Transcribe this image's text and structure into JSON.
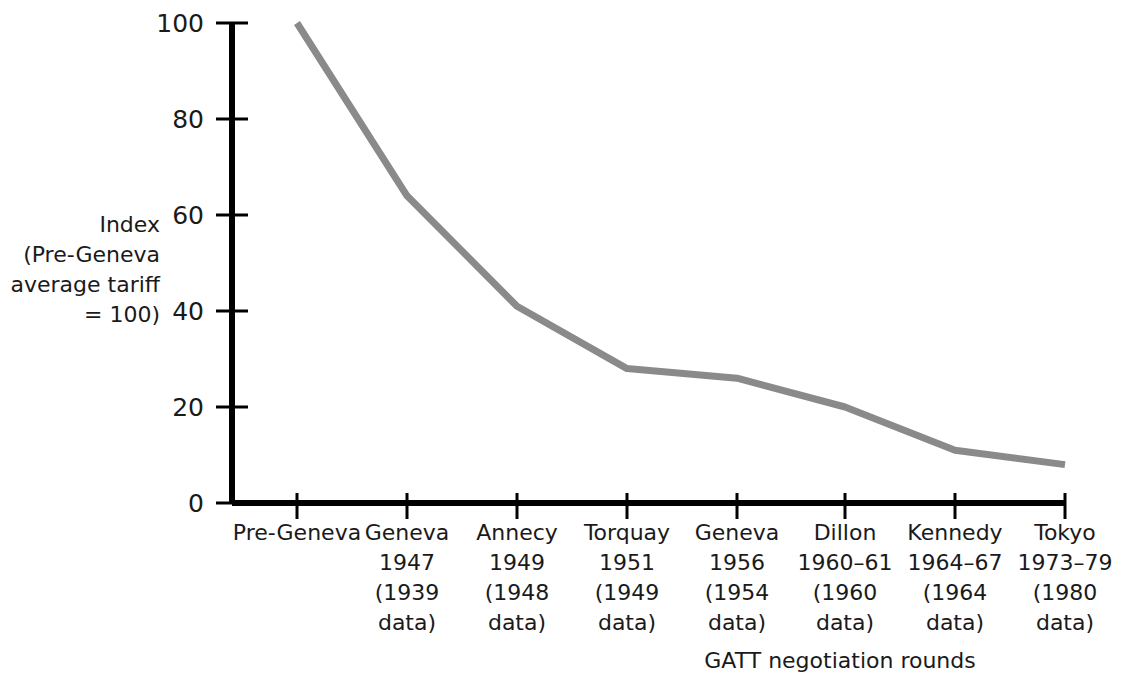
{
  "chart_data": {
    "type": "line",
    "title": "",
    "subtitle": "",
    "xlabel": "GATT negotiation rounds",
    "ylabel": "Index (Pre-Geneva average tariff = 100)",
    "ylabel_lines": [
      "Index",
      "(Pre-Geneva",
      "average tariff",
      "= 100)"
    ],
    "categories": [
      "Pre-Geneva",
      "Geneva 1947 (1939 data)",
      "Annecy 1949 (1948 data)",
      "Torquay 1951 (1949 data)",
      "Geneva 1956 (1954 data)",
      "Dillon 1960–61 (1960 data)",
      "Kennedy 1964–67 (1964 data)",
      "Tokyo 1973–79 (1980 data)"
    ],
    "category_lines": [
      [
        "Pre-Geneva"
      ],
      [
        "Geneva",
        "1947",
        "(1939",
        "data)"
      ],
      [
        "Annecy",
        "1949",
        "(1948",
        "data)"
      ],
      [
        "Torquay",
        "1951",
        "(1949",
        "data)"
      ],
      [
        "Geneva",
        "1956",
        "(1954",
        "data)"
      ],
      [
        "Dillon",
        "1960–61",
        "(1960",
        "data)"
      ],
      [
        "Kennedy",
        "1964–67",
        "(1964",
        "data)"
      ],
      [
        "Tokyo",
        "1973–79",
        "(1980",
        "data)"
      ]
    ],
    "values": [
      100,
      64,
      41,
      28,
      26,
      20,
      11,
      8
    ],
    "ylim": [
      0,
      100
    ],
    "ytick_values": [
      0,
      20,
      40,
      60,
      80,
      100
    ],
    "ytick_labels": [
      "0",
      "20",
      "40",
      "60",
      "80",
      "100"
    ],
    "grid": false,
    "legend": false,
    "legend_position": "none",
    "series": [
      {
        "name": "Index (Pre-Geneva average tariff = 100)",
        "values": [
          100,
          64,
          41,
          28,
          26,
          20,
          11,
          8
        ],
        "color": "#8a8a8a"
      }
    ]
  },
  "colors": {
    "line": "#8a8a8a",
    "axis": "#000000",
    "text": "#1a1a1a",
    "background": "#ffffff"
  }
}
